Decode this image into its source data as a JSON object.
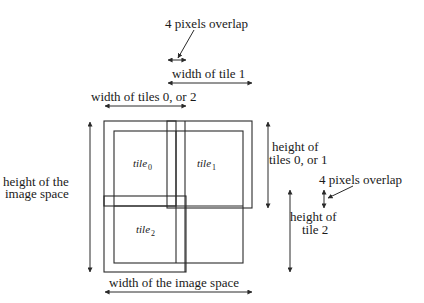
{
  "diagram": {
    "labels": {
      "overlap_top": "4 pixels overlap",
      "width_tile1": "width of tile 1",
      "width_tiles02": "width of tiles 0, or 2",
      "height_image_line1": "height of the",
      "height_image_line2": "image space",
      "height_tiles01_line1": "height of",
      "height_tiles01_line2": "tiles 0, or 1",
      "overlap_right": "4 pixels overlap",
      "height_tile2_line1": "height of",
      "height_tile2_line2": "tile 2",
      "width_image": "width of the image space"
    },
    "tiles": [
      {
        "name": "tile",
        "index": "0"
      },
      {
        "name": "tile",
        "index": "1"
      },
      {
        "name": "tile",
        "index": "2"
      }
    ],
    "colors": {
      "line": "#2a2a2a",
      "text": "#1a1a1a",
      "background": "#ffffff"
    }
  }
}
